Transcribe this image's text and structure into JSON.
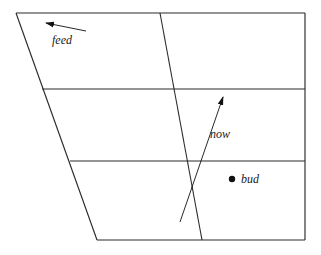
{
  "figure": {
    "type": "line-diagram",
    "background_color": "#ffffff",
    "stroke_color": "#2b2b2b",
    "text_color": "#1a1a1a",
    "width": 321,
    "height": 255
  },
  "shape": {
    "name": "trapezoid-outline",
    "description": "quadrilateral with slanted left edge",
    "corners": {
      "top_left": [
        16,
        13
      ],
      "top_right": [
        305,
        13
      ],
      "bottom_right": [
        305,
        240
      ],
      "bottom_left": [
        97,
        240
      ]
    }
  },
  "internal_lines": [
    {
      "name": "upper-horizontal-divider",
      "from": [
        42,
        89
      ],
      "to": [
        305,
        89
      ]
    },
    {
      "name": "lower-horizontal-divider",
      "from": [
        70,
        161
      ],
      "to": [
        305,
        161
      ]
    },
    {
      "name": "slanted-crossing-line",
      "from": [
        160,
        13
      ],
      "to": [
        202,
        240
      ]
    }
  ],
  "arrows": [
    {
      "name": "feed-arrow",
      "label": "feed",
      "tail": [
        86,
        31
      ],
      "tip": [
        45,
        23
      ],
      "label_position": [
        52,
        44
      ],
      "direction": "left"
    },
    {
      "name": "now-arrow",
      "label": "now",
      "tail": [
        180,
        222
      ],
      "tip": [
        224,
        94
      ],
      "label_position": [
        210,
        138
      ],
      "direction": "up-right"
    }
  ],
  "points": [
    {
      "name": "bud-point",
      "label": "bud",
      "position": [
        232,
        179
      ],
      "radius": 3.2,
      "label_position": [
        241,
        183
      ]
    }
  ],
  "labels": {
    "feed": "feed",
    "now": "now",
    "bud": "bud"
  }
}
